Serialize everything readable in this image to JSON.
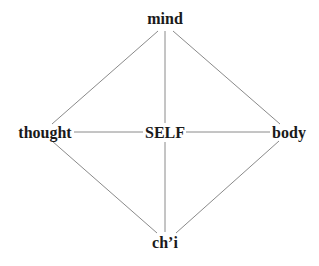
{
  "header": {
    "cut_off_text": "··· ··· ··· ···"
  },
  "diagram": {
    "type": "diamond-graph",
    "nodes": {
      "top": {
        "label": "mind",
        "x": 165,
        "y": 19
      },
      "left": {
        "label": "thought",
        "x": 45,
        "y": 133
      },
      "center": {
        "label": "SELF",
        "x": 165,
        "y": 133
      },
      "right": {
        "label": "body",
        "x": 289,
        "y": 133
      },
      "bottom": {
        "label": "ch’i",
        "x": 165,
        "y": 243
      }
    },
    "edges": [
      {
        "from": "mind",
        "to": "thought"
      },
      {
        "from": "mind",
        "to": "body"
      },
      {
        "from": "mind",
        "to": "SELF"
      },
      {
        "from": "thought",
        "to": "SELF"
      },
      {
        "from": "SELF",
        "to": "body"
      },
      {
        "from": "SELF",
        "to": "ch’i"
      },
      {
        "from": "thought",
        "to": "ch’i"
      },
      {
        "from": "body",
        "to": "ch’i"
      }
    ],
    "colors": {
      "text": "#1a1a1a",
      "lines": "#8a8a8a",
      "background": "#ffffff"
    }
  }
}
